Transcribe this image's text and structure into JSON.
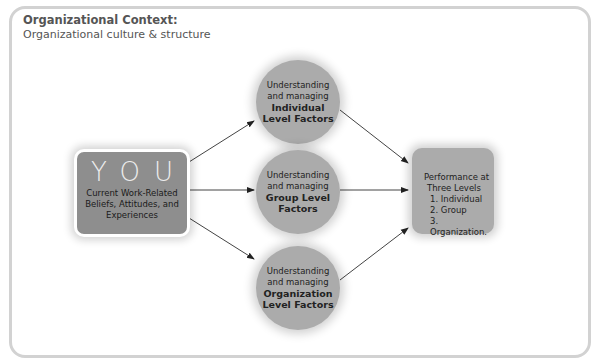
{
  "context": {
    "title": "Organizational Context:",
    "subtitle": "Organizational culture & structure"
  },
  "you_box": {
    "big": "YOU",
    "lines": [
      "Current Work-Related",
      "Beliefs, Attitudes, and",
      "Experiences"
    ]
  },
  "factors": [
    {
      "intro1": "Understanding",
      "intro2": "and managing",
      "bold1": "Individual",
      "bold2": "Level Factors"
    },
    {
      "intro1": "Understanding",
      "intro2": "and managing",
      "bold1": "Group Level",
      "bold2": "Factors"
    },
    {
      "intro1": "Understanding",
      "intro2": "and managing",
      "bold1": "Organization",
      "bold2": "Level Factors"
    }
  ],
  "performance": {
    "line1": "Performance at",
    "line2": "Three Levels",
    "items": [
      "1.  Individual",
      "2.  Group",
      "3.  Organization."
    ]
  },
  "colors": {
    "you_box": "#8e8e8e",
    "circles": "#ababab",
    "frame_border": "#d2d2d2"
  }
}
